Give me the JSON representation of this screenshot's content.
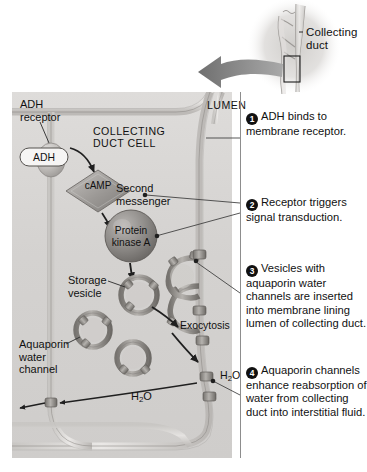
{
  "figure": {
    "callout": {
      "line1": "Collecting",
      "line2": "duct"
    }
  },
  "panel": {
    "labels": {
      "adh_receptor": "ADH\nreceptor",
      "adh_receptor_l1": "ADH",
      "adh_receptor_l2": "receptor",
      "collecting_duct_cell_l1": "COLLECTING",
      "collecting_duct_cell_l2": "DUCT CELL",
      "lumen": "LUMEN",
      "second_messenger_l1": "Second",
      "second_messenger_l2": "messenger",
      "storage_vesicle_l1": "Storage",
      "storage_vesicle_l2": "vesicle",
      "aquaporin_l1": "Aquaporin",
      "aquaporin_l2": "water",
      "aquaporin_l3": "channel",
      "exocytosis": "Exocytosis",
      "water_apical": "H",
      "water_apical_sub": "2",
      "water_apical_end": "O",
      "water_basal": "H",
      "water_basal_sub": "2",
      "water_basal_end": "O"
    },
    "shapes": {
      "adh": "ADH",
      "camp": "cAMP",
      "pka_l1": "Protein",
      "pka_l2": "kinase A"
    }
  },
  "steps": [
    {
      "number": "1",
      "text": "ADH binds to membrane receptor."
    },
    {
      "number": "2",
      "text": "Receptor triggers signal transduction."
    },
    {
      "number": "3",
      "text": "Vesicles with aquaporin water channels are inserted into membrane lining lumen of collecting duct."
    },
    {
      "number": "4",
      "text": "Aquaporin channels enhance reabsorption of water from collecting duct into interstitial fluid."
    }
  ],
  "colors": {
    "panel_background": "#d6d4d2",
    "membrane": "#b9b6b3",
    "badge": "#111111",
    "arrow": "#2b2b2b",
    "callout_arrow": "#8a8a8a",
    "text": "#111111"
  }
}
